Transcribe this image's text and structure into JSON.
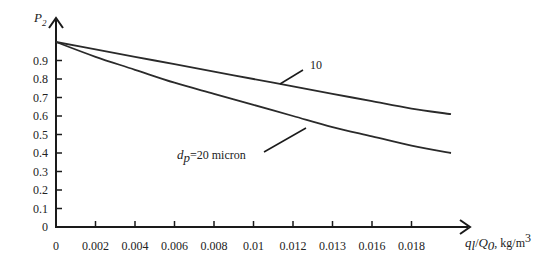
{
  "chart_data": {
    "type": "line",
    "title": "",
    "xlabel": "q_l/Q_0, kg/m^3",
    "ylabel": "P_2",
    "xlim": [
      0,
      0.02
    ],
    "ylim": [
      0,
      1.0
    ],
    "grid": false,
    "legend": "inline annotations",
    "x_tick_labels": [
      "0",
      "0.002",
      "0.004",
      "0.006",
      "0.008",
      "0.01",
      "0.012",
      "0.013",
      "0.016",
      "0.018"
    ],
    "x_ticks": [
      0,
      0.002,
      0.004,
      0.006,
      0.008,
      0.01,
      0.012,
      0.014,
      0.016,
      0.018
    ],
    "y_tick_labels": [
      "0",
      "0.1",
      "0.2",
      "0.3",
      "0.4",
      "0.5",
      "0.6",
      "0.7",
      "0.8",
      "0.9"
    ],
    "y_ticks": [
      0,
      0.1,
      0.2,
      0.3,
      0.4,
      0.5,
      0.6,
      0.7,
      0.8,
      0.9
    ],
    "x": [
      0,
      0.002,
      0.004,
      0.006,
      0.008,
      0.01,
      0.012,
      0.014,
      0.016,
      0.018,
      0.02
    ],
    "series": [
      {
        "name": "10",
        "values": [
          1.0,
          0.96,
          0.92,
          0.88,
          0.84,
          0.8,
          0.76,
          0.72,
          0.68,
          0.64,
          0.61
        ]
      },
      {
        "name": "d_p=20 micron",
        "values": [
          1.0,
          0.92,
          0.85,
          0.78,
          0.72,
          0.66,
          0.6,
          0.54,
          0.49,
          0.44,
          0.4
        ]
      }
    ],
    "annotations": [
      {
        "text": "10",
        "points_to_series": "10"
      },
      {
        "text_prefix": "d",
        "text_sub": "p",
        "text_rest": "=20 micron",
        "points_to_series": "d_p=20 micron"
      }
    ]
  },
  "labels": {
    "y_axis_main": "P",
    "y_axis_sub": "2",
    "x_axis_q": "q",
    "x_axis_q_sub": "l",
    "x_axis_slash": "/",
    "x_axis_Q": "Q",
    "x_axis_Q_sub": "0",
    "x_axis_unit": ", kg/m",
    "x_axis_unit_sup": "3",
    "anno_10": "10",
    "anno_dp_main": "d",
    "anno_dp_sub": "p",
    "anno_dp_rest": "=20 micron"
  }
}
